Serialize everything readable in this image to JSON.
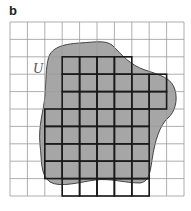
{
  "panel": {
    "label": "b",
    "set_label": "U"
  },
  "colors": {
    "fill": "#a6a6a6",
    "grid_thin": "#9a9a9a",
    "grid_thick": "#1a1a1a",
    "outline": "#333333"
  },
  "grid": {
    "x0": 10,
    "y0": 22,
    "cell": 17.4,
    "cols": 10,
    "rows": 10
  },
  "inner_squares": [
    {
      "row": 2,
      "from_col": 3,
      "to_col": 6
    },
    {
      "row": 3,
      "from_col": 3,
      "to_col": 8
    },
    {
      "row": 4,
      "from_col": 3,
      "to_col": 8
    },
    {
      "row": 5,
      "from_col": 2,
      "to_col": 7
    },
    {
      "row": 6,
      "from_col": 2,
      "to_col": 7
    },
    {
      "row": 7,
      "from_col": 2,
      "to_col": 7
    },
    {
      "row": 8,
      "from_col": 2,
      "to_col": 7
    },
    {
      "row": 9,
      "from_col": 3,
      "to_col": 7
    }
  ]
}
